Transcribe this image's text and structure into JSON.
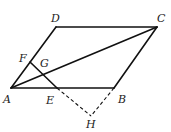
{
  "diagram": {
    "type": "geometry",
    "shape": "parallelogram ABCD",
    "points": {
      "A": {
        "label": "A",
        "x": 11,
        "y": 88
      },
      "B": {
        "label": "B",
        "x": 114,
        "y": 88
      },
      "C": {
        "label": "C",
        "x": 157,
        "y": 27
      },
      "D": {
        "label": "D",
        "x": 56,
        "y": 27
      },
      "F": {
        "label": "F",
        "x": 30,
        "y": 62
      },
      "G": {
        "label": "G",
        "x": 40,
        "y": 70
      },
      "E": {
        "label": "E",
        "x": 57,
        "y": 88
      },
      "H": {
        "label": "H",
        "x": 91,
        "y": 116
      }
    },
    "solid_segments": [
      "AB",
      "BC",
      "CD",
      "DA",
      "AC",
      "FE"
    ],
    "dashed_segments": [
      "EH",
      "BH"
    ],
    "line_color": "#111111"
  }
}
